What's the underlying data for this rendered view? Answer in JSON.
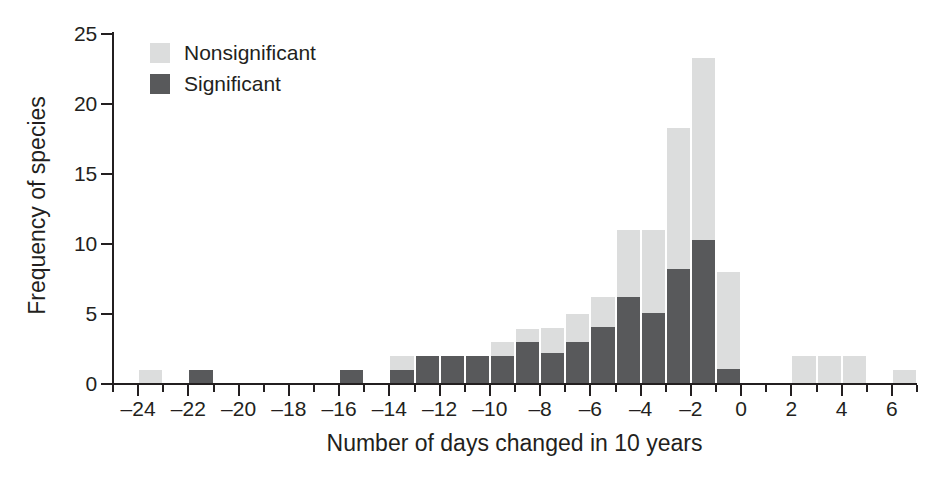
{
  "chart_data": {
    "type": "bar",
    "subtype": "stacked-histogram",
    "title": "",
    "xlabel": "Number of days changed in 10 years",
    "ylabel": "Frequency of species",
    "xlim": [
      -25,
      7
    ],
    "ylim": [
      0,
      25
    ],
    "grid": false,
    "legend_position": "top-left",
    "x_tick_labels": [
      "-24",
      "-22",
      "-20",
      "-18",
      "-16",
      "-14",
      "-12",
      "-10",
      "-8",
      "-6",
      "-4",
      "-2",
      "0",
      "2",
      "4",
      "6"
    ],
    "x_tick_values": [
      -24,
      -22,
      -20,
      -18,
      -16,
      -14,
      -12,
      -10,
      -8,
      -6,
      -4,
      -2,
      0,
      2,
      4,
      6
    ],
    "x_minor_tick_values": [
      -25,
      -23,
      -21,
      -19,
      -17,
      -15,
      -13,
      -11,
      -9,
      -7,
      -5,
      -3,
      -1,
      1,
      3,
      5,
      7
    ],
    "y_tick_labels": [
      "0",
      "5",
      "10",
      "15",
      "20",
      "25"
    ],
    "y_tick_values": [
      0,
      5,
      10,
      15,
      20,
      25
    ],
    "categories": [
      -24,
      -23,
      -22,
      -21,
      -20,
      -19,
      -18,
      -17,
      -16,
      -15,
      -14,
      -13,
      -12,
      -11,
      -10,
      -9,
      -8,
      -7,
      -6,
      -5,
      -4,
      -3,
      -2,
      -1,
      0,
      1,
      2,
      3,
      4,
      5,
      6
    ],
    "series": [
      {
        "name": "Significant",
        "color": "#58595b",
        "values": [
          0,
          0,
          1,
          0,
          0,
          0,
          0,
          0,
          1,
          0,
          1,
          2,
          2,
          2,
          2,
          3,
          2.2,
          3,
          4.1,
          6.2,
          5.1,
          8.2,
          10.3,
          1.1,
          0,
          0,
          0,
          0,
          0,
          0,
          0
        ]
      },
      {
        "name": "Nonsignificant",
        "color": "#dcdddd",
        "values": [
          1,
          0,
          0,
          0,
          0,
          0,
          0,
          0,
          0,
          0,
          1,
          0,
          0,
          0,
          1,
          0.9,
          1.8,
          2,
          2.1,
          4.8,
          5.9,
          10.1,
          13,
          6.9,
          0,
          0,
          2,
          2,
          2,
          0,
          1
        ]
      }
    ],
    "totals": [
      1,
      0,
      1,
      0,
      0,
      0,
      0,
      0,
      1,
      0,
      2,
      2,
      2,
      2,
      3,
      3.9,
      4,
      5,
      6.2,
      11,
      11,
      18.3,
      23.3,
      8,
      0,
      0,
      2,
      2,
      2,
      0,
      1
    ]
  },
  "legend": {
    "items": [
      {
        "label": "Nonsignificant",
        "swatch": "legend-swatch-nonsignificant"
      },
      {
        "label": "Significant",
        "swatch": "legend-swatch-significant"
      }
    ]
  },
  "axes": {
    "y_title": "Frequency of species",
    "x_title": "Number of days changed in 10 years"
  },
  "colors": {
    "significant": "#58595b",
    "nonsignificant": "#dcdddd",
    "axis": "#231f20",
    "background": "#ffffff"
  }
}
